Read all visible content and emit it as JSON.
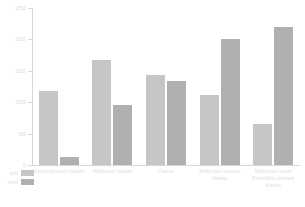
{
  "chart_data": {
    "type": "bar",
    "title": "",
    "xlabel": "",
    "ylabel": "",
    "ylim": [
      0,
      250
    ],
    "yticks": [
      0,
      50,
      100,
      150,
      200,
      250
    ],
    "ytick_labels": [
      "0",
      "50",
      "100",
      "150",
      "200",
      "250"
    ],
    "grid": false,
    "legend_position": "bottom-left",
    "categories": [
      "Sandingstones blades",
      "Multimber blades",
      "Flakes",
      "Multimber crested blades",
      "Multimber upper Paleolithic crested blades"
    ],
    "series": [
      {
        "name": "soft",
        "color": "#c6c6c6",
        "values": [
          118,
          168,
          143,
          112,
          65
        ]
      },
      {
        "name": "hard",
        "color": "#b0b0b0",
        "values": [
          13,
          95,
          133,
          200,
          220
        ]
      }
    ]
  },
  "legend": {
    "items": [
      {
        "label": "soft"
      },
      {
        "label": "hard"
      }
    ]
  }
}
